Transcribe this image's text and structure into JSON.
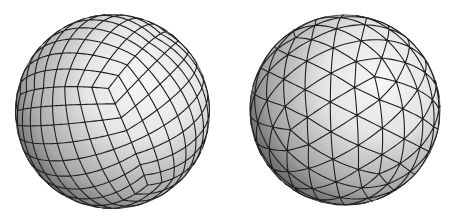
{
  "figure": {
    "width": 455,
    "height": 219,
    "background": "#ffffff",
    "line_color": "#1e1e1e",
    "shade_light": "#f6f6f6",
    "shade_mid": "#b8b8b8",
    "shade_dark": "#3c3c3c"
  },
  "spheres": [
    {
      "id": "quad-sphere",
      "label": "Quadrilateral cube-sphere mesh",
      "mesh_type": "cube-sphere",
      "cx": 112.5,
      "cy": 111.5,
      "r": 97,
      "subdivisions": 8,
      "rot_x_deg": 28,
      "rot_y_deg": -38,
      "rot_z_deg": 4,
      "line_width": 1.1
    },
    {
      "id": "tri-sphere",
      "label": "Triangulated geodesic icosphere mesh",
      "mesh_type": "icosphere",
      "cx": 345,
      "cy": 110,
      "r": 95,
      "frequency": 4,
      "rot_x_deg": 14,
      "rot_y_deg": 22,
      "rot_z_deg": 8,
      "line_width": 1.1
    }
  ]
}
